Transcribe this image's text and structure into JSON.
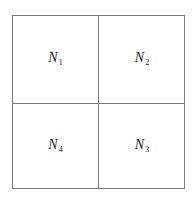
{
  "diagram": {
    "type": "2x2 grid",
    "cells": [
      {
        "position": "top-left",
        "symbol": "N",
        "subscript": "1"
      },
      {
        "position": "top-right",
        "symbol": "N",
        "subscript": "2"
      },
      {
        "position": "bottom-left",
        "symbol": "N",
        "subscript": "4"
      },
      {
        "position": "bottom-right",
        "symbol": "N",
        "subscript": "3"
      }
    ],
    "line_color": "#7a7a7a",
    "text_color": "#222222"
  }
}
